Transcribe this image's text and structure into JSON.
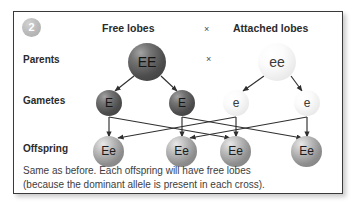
{
  "panel": {
    "badge_number": "2",
    "headers": {
      "left": "Free lobes",
      "cross_symbol": "×",
      "right": "Attached lobes"
    },
    "cross_symbol_middle": "×",
    "row_labels": {
      "parents": "Parents",
      "gametes": "Gametes",
      "offspring": "Offspring"
    },
    "parents": [
      {
        "genotype": "EE",
        "shade": "dark",
        "cx": 133,
        "cy": 50
      },
      {
        "genotype": "ee",
        "shade": "light",
        "cx": 263,
        "cy": 50
      }
    ],
    "gametes": [
      {
        "allele": "E",
        "shade": "dark",
        "cx": 95,
        "cy": 91
      },
      {
        "allele": "E",
        "shade": "dark",
        "cx": 168,
        "cy": 91
      },
      {
        "allele": "e",
        "shade": "light",
        "cx": 222,
        "cy": 91
      },
      {
        "allele": "e",
        "shade": "light",
        "cx": 293,
        "cy": 91
      }
    ],
    "offspring": [
      {
        "genotype": "Ee",
        "shade": "mid",
        "cx": 95,
        "cy": 139
      },
      {
        "genotype": "Ee",
        "shade": "mid",
        "cx": 168,
        "cy": 139
      },
      {
        "genotype": "Ee",
        "shade": "mid",
        "cx": 222,
        "cy": 139
      },
      {
        "genotype": "Ee",
        "shade": "mid",
        "cx": 293,
        "cy": 139
      }
    ],
    "caption_line1": "Same as before. Each offspring will have free lobes",
    "caption_line2": "(because the dominant allele is present in each cross)."
  },
  "colors": {
    "border": "#3a3a3a",
    "text": "#2b2b2b",
    "caption_text": "#3d3d3d",
    "badge_grey": "#bdbdbd",
    "arrow": "#2f2f2f",
    "background": "#ffffff"
  }
}
